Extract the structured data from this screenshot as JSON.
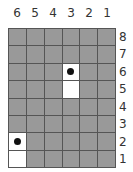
{
  "board": {
    "columns": [
      "6",
      "5",
      "4",
      "3",
      "2",
      "1"
    ],
    "rows": [
      "8",
      "7",
      "6",
      "5",
      "4",
      "3",
      "2",
      "1"
    ],
    "colors": {
      "cell": "#999999",
      "open": "#ffffff",
      "grid": "#555555",
      "piece": "#111111"
    },
    "open_cells": [
      {
        "col": "3",
        "row": "6",
        "piece": true
      },
      {
        "col": "3",
        "row": "5",
        "piece": false
      },
      {
        "col": "6",
        "row": "2",
        "piece": true
      },
      {
        "col": "6",
        "row": "1",
        "piece": false
      }
    ]
  }
}
